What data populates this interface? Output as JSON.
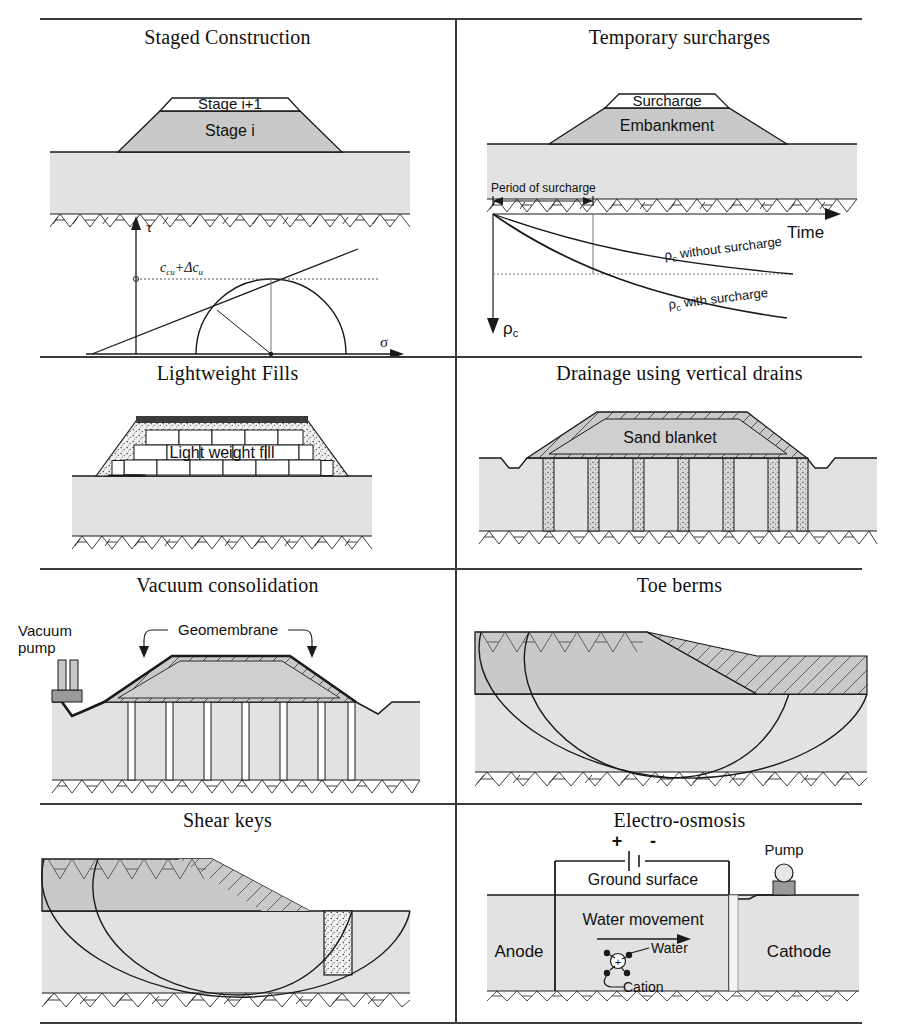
{
  "figure": {
    "title_hidden": "",
    "layout": {
      "rows": 4,
      "cols": 2
    },
    "colors": {
      "embankment_fill": "#c9c9c9",
      "ground_fill": "#e2e2e2",
      "line": "#1a1a1a",
      "rule": "#3a3a3a",
      "stage_upper_fill": "#ffffff",
      "granular_fill": "#efefef",
      "drain_fill": "#d8d8d8",
      "asphalt_cap": "#3b3b3b"
    }
  },
  "panels": [
    {
      "id": "staged-construction",
      "title": "Staged Construction",
      "labels": {
        "stage_upper": "Stage i+1",
        "stage_lower": "Stage i"
      },
      "chart": {
        "type": "scatter",
        "title": "Mohr circle with failure envelope",
        "xlabel": "σ",
        "ylabel": "τ",
        "annotation": "c_cu+Δc_u",
        "annotation_parts": {
          "base": "c",
          "base_sub": "cu",
          "plus": "+Δc",
          "delta_sub": "u"
        }
      }
    },
    {
      "id": "temporary-surcharges",
      "title": "Temporary surcharges",
      "labels": {
        "surcharge": "Surcharge",
        "embankment": "Embankment",
        "period": "Period of surcharge"
      },
      "chart": {
        "type": "line",
        "title": "Settlement versus time",
        "xlabel": "Time",
        "ylabel": "ρc",
        "ylabel_parts": {
          "base": "ρ",
          "sub": "c"
        },
        "series": [
          {
            "name": "ρc without surcharge",
            "label_parts": {
              "base": "ρ",
              "sub": "c",
              "rest": " without surcharge"
            }
          },
          {
            "name": "ρc with surcharge",
            "label_parts": {
              "base": "ρ",
              "sub": "c",
              "rest": " with surcharge"
            }
          }
        ]
      }
    },
    {
      "id": "lightweight-fills",
      "title": "Lightweight Fills",
      "labels": {
        "fill": "Light weight fill"
      }
    },
    {
      "id": "vertical-drains",
      "title": "Drainage using vertical drains",
      "labels": {
        "blanket": "Sand blanket"
      },
      "counts": {
        "drains": 7
      }
    },
    {
      "id": "vacuum-consolidation",
      "title": "Vacuum consolidation",
      "labels": {
        "pump_line1": "Vacuum",
        "pump_line2": "pump",
        "geomembrane": "Geomembrane"
      },
      "counts": {
        "drains": 7
      }
    },
    {
      "id": "toe-berms",
      "title": "Toe berms",
      "labels": {}
    },
    {
      "id": "shear-keys",
      "title": "Shear keys",
      "labels": {}
    },
    {
      "id": "electro-osmosis",
      "title": "Electro-osmosis",
      "labels": {
        "plus": "+",
        "minus": "-",
        "ground_surface": "Ground surface",
        "water_movement": "Water movement",
        "anode": "Anode",
        "cathode": "Cathode",
        "water": "Water",
        "cation": "Cation",
        "cation_charge": "+",
        "pump": "Pump"
      }
    }
  ]
}
